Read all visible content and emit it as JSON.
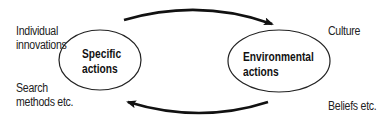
{
  "diagram": {
    "nodes": [
      {
        "id": "specific",
        "line1": "Specific",
        "line2": "actions"
      },
      {
        "id": "environmental",
        "line1": "Environmental",
        "line2": "actions"
      }
    ],
    "left_labels": {
      "top_line1": "Individual",
      "top_line2": "innovations",
      "bottom_line1": "Search",
      "bottom_line2": "methods etc."
    },
    "right_labels": {
      "top": "Culture",
      "bottom": "Beliefs etc."
    },
    "edges": [
      {
        "from": "specific",
        "to": "environmental",
        "position": "top"
      },
      {
        "from": "environmental",
        "to": "specific",
        "position": "bottom"
      }
    ],
    "colors": {
      "stroke": "#111111",
      "background": "#ffffff"
    }
  }
}
